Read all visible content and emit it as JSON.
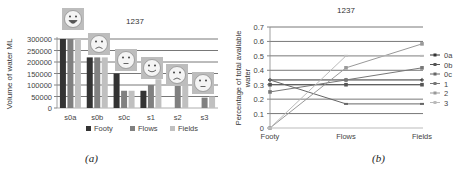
{
  "chart_data": [
    {
      "type": "bar",
      "panel": "(a)",
      "title": "1237",
      "xlabel": "",
      "ylabel": "Volume of water ML",
      "ylim": [
        0,
        300000
      ],
      "yticks": [
        0,
        50000,
        100000,
        150000,
        200000,
        250000,
        300000
      ],
      "grid": true,
      "legend_position": "bottom",
      "categories": [
        "s0a",
        "s0b",
        "s0c",
        "s1",
        "s2",
        "s3"
      ],
      "series": [
        {
          "name": "Footy",
          "color": "#333333",
          "values": [
            300000,
            220000,
            150000,
            75000,
            0,
            0
          ]
        },
        {
          "name": "Flows",
          "color": "#808080",
          "values": [
            300000,
            220000,
            75000,
            100000,
            100000,
            45000
          ]
        },
        {
          "name": "Fields",
          "color": "#c0c0c0",
          "values": [
            300000,
            220000,
            75000,
            125000,
            100000,
            50000
          ]
        }
      ],
      "annotations": [
        {
          "category": "s0a",
          "icon": "big-smile-face-icon"
        },
        {
          "category": "s0b",
          "icon": "sad-face-icon"
        },
        {
          "category": "s0c",
          "icon": "neutral-face-icon"
        },
        {
          "category": "s1",
          "icon": "smile-face-icon"
        },
        {
          "category": "s2",
          "icon": "sad-face-icon"
        },
        {
          "category": "s3",
          "icon": "neutral-face-icon"
        }
      ]
    },
    {
      "type": "line",
      "panel": "(b)",
      "title": "1237",
      "xlabel": "",
      "ylabel": "Percentage of total available water",
      "ylim": [
        0,
        0.7
      ],
      "yticks": [
        0,
        0.1,
        0.2,
        0.3,
        0.4,
        0.5,
        0.6,
        0.7
      ],
      "grid": true,
      "legend_position": "right",
      "x": [
        "Footy",
        "Flows",
        "Fields"
      ],
      "series": [
        {
          "name": "0a",
          "color": "#333333",
          "marker": "plus",
          "values": [
            0.333,
            0.333,
            0.333
          ]
        },
        {
          "name": "0b",
          "color": "#555555",
          "marker": "square",
          "values": [
            0.3,
            0.3,
            0.3
          ]
        },
        {
          "name": "0c",
          "color": "#666666",
          "marker": "dash",
          "values": [
            0.333,
            0.167,
            0.167
          ]
        },
        {
          "name": "1",
          "color": "#777777",
          "marker": "square",
          "values": [
            0.25,
            0.333,
            0.417
          ]
        },
        {
          "name": "2",
          "color": "#999999",
          "marker": "square",
          "values": [
            0,
            0.417,
            0.583
          ]
        },
        {
          "name": "3",
          "color": "#bbbbbb",
          "marker": "dash",
          "values": [
            0,
            0.5,
            0.5
          ]
        }
      ]
    }
  ],
  "captions": {
    "a": "(a)",
    "b": "(b)"
  },
  "left": {
    "title": "1237",
    "ylabel": "Volume of water ML",
    "yticks": [
      "300000",
      "250000",
      "200000",
      "150000",
      "100000",
      "50000",
      "0"
    ],
    "categories": [
      "s0a",
      "s0b",
      "s0c",
      "s1",
      "s2",
      "s3"
    ],
    "legend": [
      "Footy",
      "Flows",
      "Fields"
    ]
  },
  "right": {
    "title": "1237",
    "ylabel_line1": "Percentage of total available",
    "ylabel_line2": "water",
    "yticks": [
      "0.7",
      "0.6",
      "0.5",
      "0.4",
      "0.3",
      "0.2",
      "0.1",
      "0"
    ],
    "xticks": [
      "Footy",
      "Flows",
      "Fields"
    ],
    "legend": [
      "0a",
      "0b",
      "0c",
      "1",
      "2",
      "3"
    ]
  }
}
